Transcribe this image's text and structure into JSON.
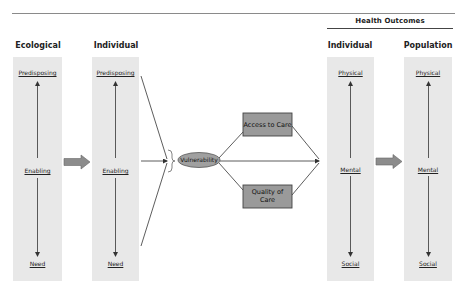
{
  "header": {
    "group_label": "Health Outcomes"
  },
  "columns": [
    {
      "id": "ecological",
      "title": "Ecological",
      "nodes": [
        "Predisposing",
        "Enabling",
        "Need"
      ]
    },
    {
      "id": "individual",
      "title": "Individual",
      "nodes": [
        "Predisposing",
        "Enabling",
        "Need"
      ]
    },
    {
      "id": "outcome-individual",
      "title": "Individual",
      "nodes": [
        "Physical",
        "Mental",
        "Social"
      ]
    },
    {
      "id": "outcome-population",
      "title": "Population",
      "nodes": [
        "Physical",
        "Mental",
        "Social"
      ]
    }
  ],
  "center": {
    "vulnerability": "Vulnerability",
    "access_to_care": "Access to Care",
    "quality_of_care_line1": "Quality of",
    "quality_of_care_line2": "Care"
  },
  "colors": {
    "panel": "#e8e8e8",
    "box_fill": "#9a9a9a",
    "ellipse_fill": "#a0a0a0",
    "arrow_fill": "#8c8c8c",
    "line": "#333333"
  }
}
